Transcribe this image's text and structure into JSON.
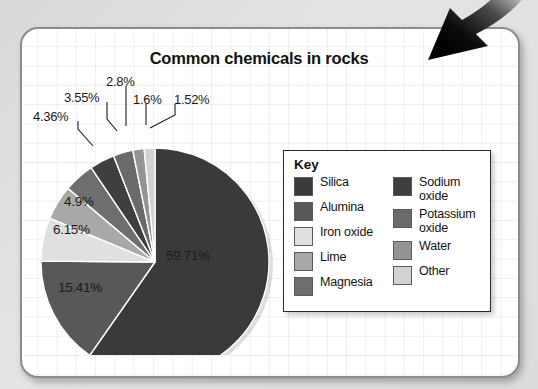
{
  "page": {
    "background_color": "#dedede",
    "card_border_color": "#8c8c8c",
    "card_background": "#ffffff"
  },
  "chart_title": "Common chemicals in rocks",
  "legend": {
    "title": "Key",
    "left_column": [
      {
        "label": "Silica",
        "color": "#3a3a3a"
      },
      {
        "label": "Alumina",
        "color": "#585858"
      },
      {
        "label": "Iron oxide",
        "color": "#e0e0e0"
      },
      {
        "label": "Lime",
        "color": "#a8a8a8"
      },
      {
        "label": "Magnesia",
        "color": "#6e6e6e"
      }
    ],
    "right_column": [
      {
        "label": "Sodium oxide",
        "color": "#3f3f3f"
      },
      {
        "label": "Potassium oxide",
        "color": "#6a6a6a"
      },
      {
        "label": "Water",
        "color": "#949494"
      },
      {
        "label": "Other",
        "color": "#d2d2d2"
      }
    ]
  },
  "arrow": {
    "name": "curved-down-left-arrow",
    "color": "#0a0a0a"
  },
  "chart_data": {
    "type": "pie",
    "title": "Common chemicals in rocks",
    "xlabel": "",
    "ylabel": "",
    "legend_position": "right",
    "grid": false,
    "start_angle_deg": 0,
    "direction": "clockwise",
    "labels": [
      "Silica",
      "Alumina",
      "Iron oxide",
      "Lime",
      "Magnesia",
      "Sodium oxide",
      "Potassium oxide",
      "Water",
      "Other"
    ],
    "values": [
      59.71,
      15.41,
      6.15,
      4.9,
      4.36,
      3.55,
      2.8,
      1.6,
      1.52
    ],
    "value_labels": [
      "59.71%",
      "15.41%",
      "6.15%",
      "4.9%",
      "4.36%",
      "3.55%",
      "2.8%",
      "1.6%",
      "1.52%"
    ],
    "colors": [
      "#3a3a3a",
      "#585858",
      "#e0e0e0",
      "#a8a8a8",
      "#6e6e6e",
      "#3f3f3f",
      "#6a6a6a",
      "#949494",
      "#d2d2d2"
    ],
    "units": "percent",
    "total": 100.0,
    "slices": [
      {
        "label": "Silica",
        "value": 59.71,
        "value_label": "59.71%",
        "color": "#3a3a3a",
        "label_placement": "inside"
      },
      {
        "label": "Alumina",
        "value": 15.41,
        "value_label": "15.41%",
        "color": "#585858",
        "label_placement": "inside"
      },
      {
        "label": "Iron oxide",
        "value": 6.15,
        "value_label": "6.15%",
        "color": "#e0e0e0",
        "label_placement": "inside"
      },
      {
        "label": "Lime",
        "value": 4.9,
        "value_label": "4.9%",
        "color": "#a8a8a8",
        "label_placement": "inside"
      },
      {
        "label": "Magnesia",
        "value": 4.36,
        "value_label": "4.36%",
        "color": "#6e6e6e",
        "label_placement": "outside-leader"
      },
      {
        "label": "Sodium oxide",
        "value": 3.55,
        "value_label": "3.55%",
        "color": "#3f3f3f",
        "label_placement": "outside-leader"
      },
      {
        "label": "Potassium oxide",
        "value": 2.8,
        "value_label": "2.8%",
        "color": "#6a6a6a",
        "label_placement": "outside-leader"
      },
      {
        "label": "Water",
        "value": 1.6,
        "value_label": "1.6%",
        "color": "#949494",
        "label_placement": "outside-leader"
      },
      {
        "label": "Other",
        "value": 1.52,
        "value_label": "1.52%",
        "color": "#d2d2d2",
        "label_placement": "outside-leader"
      }
    ]
  }
}
